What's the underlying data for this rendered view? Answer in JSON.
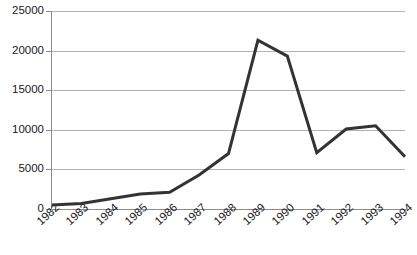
{
  "chart_data": {
    "type": "line",
    "title": "",
    "subtitle": "",
    "xlabel": "",
    "ylabel": "",
    "categories": [
      "1982",
      "1983",
      "1984",
      "1985",
      "1986",
      "1987",
      "1988",
      "1989",
      "1990",
      "1991",
      "1992",
      "1993",
      "1994"
    ],
    "x": [
      1982,
      1983,
      1984,
      1985,
      1986,
      1987,
      1988,
      1989,
      1990,
      1991,
      1992,
      1993,
      1994
    ],
    "values": [
      500,
      700,
      1300,
      1900,
      2100,
      4300,
      7000,
      21300,
      19300,
      7100,
      10100,
      10500,
      6600
    ],
    "series": [
      {
        "name": "",
        "values": [
          500,
          700,
          1300,
          1900,
          2100,
          4300,
          7000,
          21300,
          19300,
          7100,
          10100,
          10500,
          6600
        ],
        "color": "#333333"
      }
    ],
    "ylim": [
      0,
      25000
    ],
    "ytick_labels": [
      "0",
      "5000",
      "10000",
      "15000",
      "20000",
      "25000"
    ],
    "ytick_values": [
      0,
      5000,
      10000,
      15000,
      20000,
      25000
    ],
    "grid": true,
    "grid_axis": "y",
    "legend": false,
    "legend_position": "none",
    "markers": false,
    "line_width": 3,
    "colors": {
      "line": "#333333",
      "grid": "#b3b3b3",
      "axis": "#8c8c8c",
      "text": "#1a1a1a",
      "background": "#ffffff"
    }
  }
}
